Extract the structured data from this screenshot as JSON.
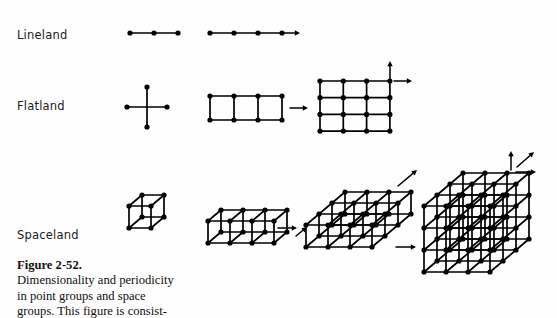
{
  "figure": {
    "row_labels": [
      {
        "id": "lineland",
        "text": "Lineland"
      },
      {
        "id": "flatland",
        "text": "Flatland"
      },
      {
        "id": "spaceland",
        "text": "Spaceland"
      }
    ],
    "caption": {
      "title": "Figure 2-52.",
      "line1": "Dimensionality and periodicity",
      "line2": "in point groups and space",
      "line3": "groups. This figure is consist-"
    },
    "style": {
      "ink": "#000000",
      "background": "#fefefe",
      "node_radius": 2.6,
      "edge_width": 1.7,
      "arrow_width": 1.5
    },
    "diagrams": [
      {
        "name": "lineland-point-group",
        "row": "lineland",
        "kind": "lattice",
        "nx": 3,
        "ny": 1,
        "nz": 1,
        "origin": [
          130,
          33
        ],
        "ax": [
          24,
          0
        ],
        "ay": [
          0,
          0
        ],
        "az": [
          0,
          0
        ],
        "arrows": []
      },
      {
        "name": "lineland-space-group",
        "row": "lineland",
        "kind": "lattice",
        "nx": 4,
        "ny": 1,
        "nz": 1,
        "origin": [
          210,
          33
        ],
        "ax": [
          24,
          0
        ],
        "ay": [
          0,
          0
        ],
        "az": [
          0,
          0
        ],
        "arrows": [
          {
            "name": "x-translation-arrow",
            "from": [
              282,
              33
            ],
            "to": [
              300,
              33
            ]
          }
        ]
      },
      {
        "name": "flatland-point-group",
        "row": "flatland",
        "kind": "cross",
        "center": [
          147,
          107
        ],
        "arm": 20,
        "arrows": []
      },
      {
        "name": "flatland-one-dim-periodic",
        "row": "flatland",
        "kind": "lattice",
        "nx": 4,
        "ny": 2,
        "nz": 1,
        "origin": [
          210,
          96
        ],
        "ax": [
          24,
          0
        ],
        "ay": [
          0,
          24
        ],
        "az": [
          0,
          0
        ],
        "arrows": [
          {
            "name": "x-translation-arrow",
            "from": [
              290,
              108
            ],
            "to": [
              308,
              108
            ]
          }
        ]
      },
      {
        "name": "flatland-two-dim-periodic",
        "row": "flatland",
        "kind": "lattice",
        "nx": 4,
        "ny": 4,
        "nz": 1,
        "origin": [
          320,
          81
        ],
        "ax": [
          23.3,
          0
        ],
        "ay": [
          0,
          16.7
        ],
        "az": [
          0,
          0
        ],
        "arrows": [
          {
            "name": "y-translation-arrow",
            "from": [
              390,
              81
            ],
            "to": [
              390,
              61
            ]
          },
          {
            "name": "x-translation-arrow",
            "from": [
              394,
              81
            ],
            "to": [
              412,
              81
            ]
          }
        ]
      },
      {
        "name": "spaceland-point-group",
        "row": "spaceland",
        "kind": "lattice",
        "nx": 2,
        "ny": 2,
        "nz": 2,
        "origin": [
          129,
          228
        ],
        "ax": [
          22,
          0
        ],
        "ay": [
          0,
          -22
        ],
        "az": [
          13,
          -11
        ],
        "arrows": []
      },
      {
        "name": "spaceland-one-dim-periodic",
        "row": "spaceland",
        "kind": "lattice",
        "nx": 4,
        "ny": 2,
        "nz": 2,
        "origin": [
          208,
          243
        ],
        "ax": [
          22,
          0
        ],
        "ay": [
          0,
          -22
        ],
        "az": [
          13,
          -11
        ],
        "arrows": [
          {
            "name": "x-translation-arrow",
            "from": [
              278,
              228
            ],
            "to": [
              297,
              228
            ]
          },
          {
            "name": "z-translation-arrow",
            "from": [
              296,
              236
            ],
            "to": [
              307,
              227
            ]
          }
        ]
      },
      {
        "name": "spaceland-two-dim-periodic",
        "row": "spaceland",
        "kind": "lattice",
        "nx": 4,
        "ny": 2,
        "nz": 4,
        "origin": [
          306,
          247
        ],
        "ax": [
          22,
          0
        ],
        "ay": [
          0,
          -22
        ],
        "az": [
          13,
          -11
        ],
        "arrows": [
          {
            "name": "x-translation-arrow",
            "from": [
              396,
              247
            ],
            "to": [
              416,
              247
            ]
          },
          {
            "name": "z-translation-arrow",
            "from": [
              398,
              186
            ],
            "to": [
              417,
              170
            ]
          }
        ]
      },
      {
        "name": "spaceland-three-dim-periodic",
        "row": "spaceland",
        "kind": "lattice",
        "nx": 4,
        "ny": 4,
        "nz": 4,
        "origin": [
          424,
          272
        ],
        "ax": [
          22,
          0
        ],
        "ay": [
          0,
          -22
        ],
        "az": [
          13,
          -11
        ],
        "arrows": [
          {
            "name": "y-translation-arrow",
            "from": [
              511,
              170
            ],
            "to": [
              511,
              151
            ]
          },
          {
            "name": "x-translation-arrow",
            "from": [
              516,
              172
            ],
            "to": [
              536,
              172
            ]
          },
          {
            "name": "z-translation-arrow",
            "from": [
              517,
              167
            ],
            "to": [
              534,
              152
            ]
          }
        ]
      }
    ]
  }
}
